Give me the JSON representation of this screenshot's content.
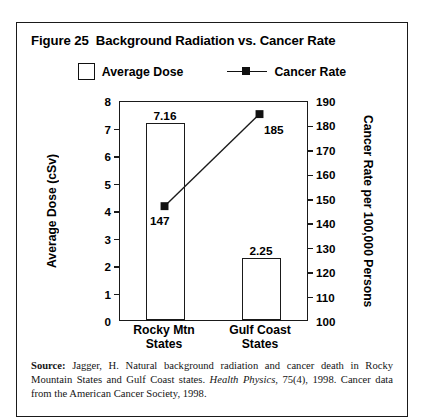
{
  "figure": {
    "title": "Figure 25  Background Radiation vs. Cancer Rate"
  },
  "legend": {
    "entries": [
      {
        "label": "Average Dose",
        "type": "bar-swatch",
        "color": "#ffffff",
        "border": "#111111"
      },
      {
        "label": "Cancer Rate",
        "type": "line-marker",
        "color": "#111111"
      }
    ]
  },
  "source": {
    "label": "Source:",
    "text_part1": " Jagger, H. Natural background radiation and cancer death in Rocky Mountain States and Gulf Coast states. ",
    "italic_part": "Health Physics",
    "text_part2": ", 75(4), 1998. Cancer data from the American Cancer Society, 1998."
  },
  "chart_data": {
    "type": "bar",
    "title": "Figure 25  Background Radiation vs. Cancer Rate",
    "categories": [
      "Rocky Mtn\nStates",
      "Gulf Coast\nStates"
    ],
    "series": [
      {
        "name": "Average Dose",
        "type": "bar",
        "axis": "left",
        "values": [
          7.16,
          2.25
        ],
        "labels": [
          "7.16",
          "2.25"
        ]
      },
      {
        "name": "Cancer Rate",
        "type": "line",
        "axis": "right",
        "values": [
          147,
          185
        ],
        "labels": [
          "147",
          "185"
        ]
      }
    ],
    "xlabel": "",
    "ylabel": "Average Dose (cSv)",
    "y2label": "Cancer Rate per 100,000 Persons",
    "ylim": [
      0,
      8
    ],
    "y2lim": [
      100,
      190
    ],
    "yticks": [
      "0",
      "1",
      "2",
      "3",
      "4",
      "5",
      "6",
      "7",
      "8"
    ],
    "y2ticks": [
      "100",
      "110",
      "120",
      "130",
      "140",
      "150",
      "160",
      "170",
      "180",
      "190"
    ],
    "grid": false,
    "legend_position": "top-center"
  }
}
